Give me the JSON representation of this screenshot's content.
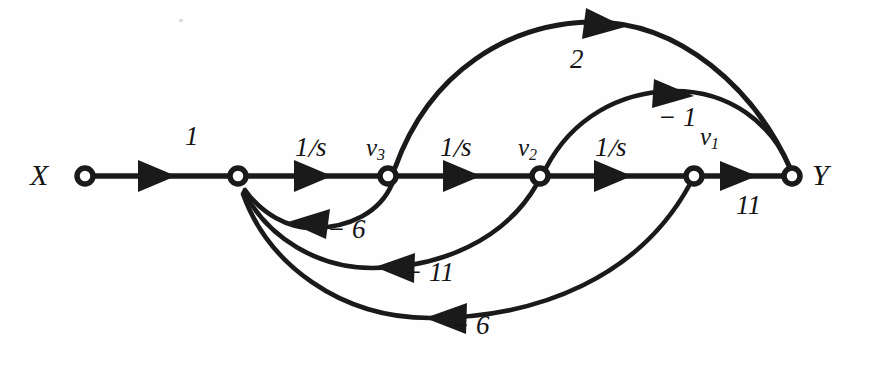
{
  "figure": {
    "type": "signal-flow-graph",
    "background_color": "#fefefe",
    "ink_color": "#1a1a1a",
    "width": 877,
    "height": 368
  },
  "nodes": [
    {
      "id": "X",
      "label": "X",
      "sub": "",
      "label_side": "left",
      "x": 85,
      "y": 176
    },
    {
      "id": "sum",
      "label": "",
      "sub": "",
      "label_side": "none",
      "x": 238,
      "y": 176
    },
    {
      "id": "v3",
      "label": "v",
      "sub": "3",
      "label_side": "above",
      "x": 388,
      "y": 176
    },
    {
      "id": "v2",
      "label": "v",
      "sub": "2",
      "label_side": "above",
      "x": 540,
      "y": 176
    },
    {
      "id": "v1",
      "label": "v",
      "sub": "1",
      "label_side": "above",
      "x": 694,
      "y": 176
    },
    {
      "id": "Y",
      "label": "Y",
      "sub": "",
      "label_side": "right",
      "x": 792,
      "y": 176
    }
  ],
  "edges": [
    {
      "from": "X",
      "to": "sum",
      "gain": "1",
      "gain_numer": "",
      "gain_denom": "",
      "kind": "straight",
      "direction": "forward"
    },
    {
      "from": "sum",
      "to": "v3",
      "gain": "1/s",
      "gain_numer": "1",
      "gain_denom": "s",
      "kind": "straight",
      "direction": "forward"
    },
    {
      "from": "v3",
      "to": "v2",
      "gain": "1/s",
      "gain_numer": "1",
      "gain_denom": "s",
      "kind": "straight",
      "direction": "forward"
    },
    {
      "from": "v2",
      "to": "v1",
      "gain": "1/s",
      "gain_numer": "1",
      "gain_denom": "s",
      "kind": "straight",
      "direction": "forward"
    },
    {
      "from": "v1",
      "to": "Y",
      "gain": "11",
      "gain_numer": "",
      "gain_denom": "",
      "kind": "straight",
      "direction": "forward"
    },
    {
      "from": "v3",
      "to": "Y",
      "gain": "2",
      "gain_numer": "",
      "gain_denom": "",
      "kind": "arc-above",
      "direction": "forward"
    },
    {
      "from": "v2",
      "to": "Y",
      "gain": "-1",
      "gain_numer": "",
      "gain_denom": "",
      "kind": "arc-above",
      "direction": "forward"
    },
    {
      "from": "v3",
      "to": "sum",
      "gain": "-6",
      "gain_numer": "",
      "gain_denom": "",
      "kind": "arc-below",
      "direction": "feedback"
    },
    {
      "from": "v2",
      "to": "sum",
      "gain": "-11",
      "gain_numer": "",
      "gain_denom": "",
      "kind": "arc-below",
      "direction": "feedback"
    },
    {
      "from": "v1",
      "to": "sum",
      "gain": "-6",
      "gain_numer": "",
      "gain_denom": "",
      "kind": "arc-below",
      "direction": "feedback"
    }
  ],
  "labels": {
    "input": "X",
    "output": "Y",
    "gain_x_sum": "1",
    "gain_sum_v3_numer": "1",
    "gain_sum_v3_denom": "s",
    "gain_v3_v2_numer": "1",
    "gain_v3_v2_denom": "s",
    "gain_v2_v1_numer": "1",
    "gain_v2_v1_denom": "s",
    "gain_v1_y": "11",
    "gain_v3_y": "2",
    "gain_v2_y": "− 1",
    "gain_fb_v3": "− 6",
    "gain_fb_v2": "− 11",
    "gain_fb_v1": "− 6",
    "node_v3_base": "v",
    "node_v3_sub": "3",
    "node_v2_base": "v",
    "node_v2_sub": "2",
    "node_v1_base": "v",
    "node_v1_sub": "1"
  }
}
